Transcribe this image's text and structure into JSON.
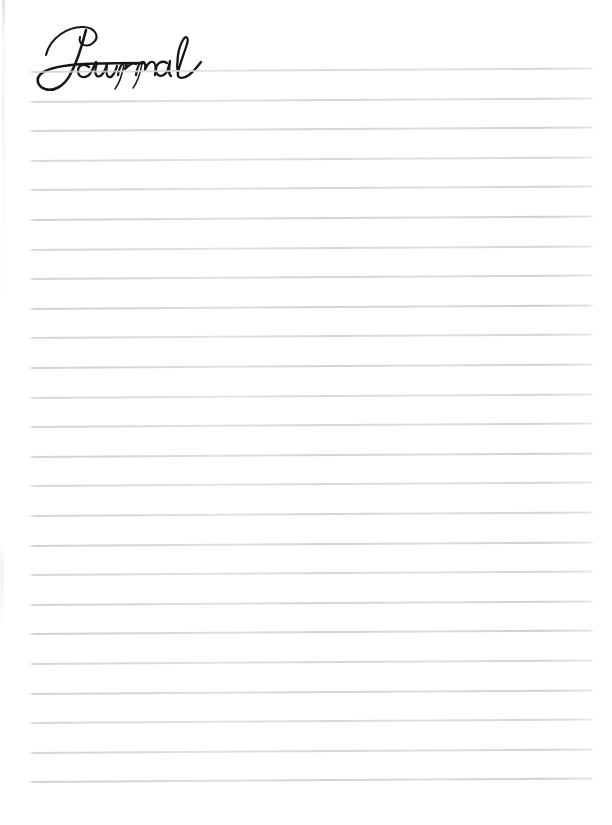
{
  "page": {
    "kind": "journal-page",
    "background_color": "#ffffff",
    "width": 612,
    "height": 825
  },
  "header": {
    "style": "handwritten-script",
    "ink_color": "#16161a"
  },
  "ruled_lines": {
    "count": 25,
    "color": "#d6d6da",
    "left_x": 28,
    "right_x": 595,
    "first_y": 72,
    "spacing": 29.6,
    "skew_degrees": -0.35,
    "thickness": 1
  },
  "writing_area": {
    "placeholder": ""
  }
}
